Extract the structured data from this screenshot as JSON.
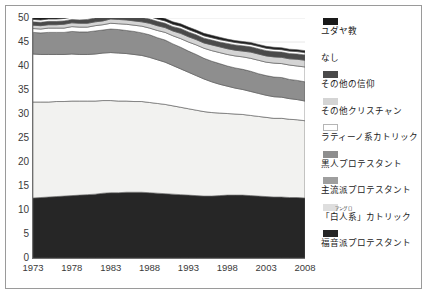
{
  "chart_data": {
    "type": "area",
    "stacked": true,
    "title": "",
    "xlabel": "",
    "ylabel": "",
    "x": [
      1973,
      1974,
      1975,
      1976,
      1977,
      1978,
      1979,
      1980,
      1981,
      1982,
      1983,
      1984,
      1985,
      1986,
      1987,
      1988,
      1989,
      1990,
      1991,
      1992,
      1993,
      1994,
      1995,
      1996,
      1997,
      1998,
      1999,
      2000,
      2001,
      2002,
      2003,
      2004,
      2005,
      2006,
      2007,
      2008
    ],
    "xticks": [
      1973,
      1978,
      1983,
      1988,
      1993,
      1998,
      2003,
      2008
    ],
    "xtick_labels": [
      "1973",
      "1978",
      "1983",
      "1988",
      "1993",
      "1998",
      "2003",
      "2008"
    ],
    "yticks": [
      0,
      5,
      10,
      15,
      20,
      25,
      30,
      35,
      40,
      45,
      50
    ],
    "ytick_labels": [
      "0",
      "5",
      "10",
      "15",
      "20",
      "25",
      "30",
      "35",
      "40",
      "45",
      "50"
    ],
    "ylim": [
      0,
      50
    ],
    "xlim": [
      1973,
      2008
    ],
    "grid": true,
    "legend_position": "right",
    "series": [
      {
        "name": "福音派プロテスタント",
        "color": "#262626",
        "values": [
          12.5,
          12.6,
          12.7,
          12.8,
          12.9,
          13.0,
          13.1,
          13.2,
          13.3,
          13.5,
          13.6,
          13.6,
          13.7,
          13.7,
          13.7,
          13.6,
          13.5,
          13.4,
          13.3,
          13.2,
          13.1,
          13.0,
          12.9,
          12.9,
          13.0,
          13.1,
          13.1,
          13.1,
          13.0,
          12.9,
          12.8,
          12.7,
          12.7,
          12.6,
          12.6,
          12.5
        ]
      },
      {
        "name": "「白人系」カトリック",
        "color": "#f2f2f0",
        "values": [
          20.0,
          19.9,
          19.8,
          19.8,
          19.7,
          19.7,
          19.6,
          19.5,
          19.4,
          19.3,
          19.2,
          19.1,
          19.0,
          18.9,
          18.9,
          18.8,
          18.7,
          18.6,
          18.4,
          18.2,
          18.0,
          17.8,
          17.6,
          17.4,
          17.2,
          17.0,
          16.9,
          16.8,
          16.7,
          16.6,
          16.5,
          16.4,
          16.4,
          16.3,
          16.2,
          16.1
        ]
      },
      {
        "name": "主流派プロテスタント",
        "color": "#ffffff",
        "values": [
          10.0,
          9.9,
          9.9,
          9.8,
          9.8,
          9.8,
          9.7,
          9.7,
          9.8,
          9.9,
          10.0,
          10.0,
          9.9,
          9.8,
          9.6,
          9.4,
          9.1,
          8.8,
          8.4,
          8.0,
          7.6,
          7.2,
          6.8,
          6.4,
          6.0,
          5.7,
          5.4,
          5.2,
          5.0,
          4.8,
          4.6,
          4.5,
          4.4,
          4.3,
          4.2,
          4.1
        ]
      },
      {
        "name": "黒人プロテスタント",
        "color": "#8e8e8e",
        "values": [
          4.5,
          4.5,
          4.6,
          4.6,
          4.6,
          4.7,
          4.7,
          4.7,
          4.8,
          4.8,
          4.9,
          4.9,
          4.8,
          4.8,
          4.7,
          4.7,
          4.6,
          4.6,
          4.5,
          4.5,
          4.4,
          4.4,
          4.3,
          4.3,
          4.3,
          4.2,
          4.2,
          4.2,
          4.2,
          4.1,
          4.1,
          4.1,
          4.1,
          4.0,
          4.0,
          4.0
        ]
      },
      {
        "name": "ラティーノ系カトリック",
        "color": "#ffffff",
        "values": [
          0.8,
          0.8,
          0.9,
          0.9,
          0.9,
          1.0,
          1.0,
          1.0,
          1.1,
          1.1,
          1.2,
          1.2,
          1.3,
          1.3,
          1.4,
          1.4,
          1.5,
          1.6,
          1.7,
          1.8,
          1.9,
          2.0,
          2.1,
          2.2,
          2.3,
          2.4,
          2.5,
          2.6,
          2.7,
          2.8,
          2.8,
          2.9,
          2.9,
          3.0,
          3.0,
          3.1
        ]
      },
      {
        "name": "その他クリスチャン",
        "color": "#d4d4d4",
        "values": [
          0.7,
          0.7,
          0.7,
          0.7,
          0.8,
          0.8,
          0.8,
          0.8,
          0.8,
          0.8,
          0.9,
          0.9,
          0.9,
          0.9,
          0.9,
          1.0,
          1.0,
          1.0,
          1.0,
          1.1,
          1.1,
          1.1,
          1.1,
          1.2,
          1.2,
          1.2,
          1.2,
          1.2,
          1.3,
          1.3,
          1.3,
          1.3,
          1.3,
          1.3,
          1.4,
          1.4
        ]
      },
      {
        "name": "その他の信仰",
        "color": "#4a4a4a",
        "values": [
          0.7,
          0.7,
          0.7,
          0.7,
          0.7,
          0.7,
          0.7,
          0.8,
          0.8,
          0.8,
          0.8,
          0.8,
          0.8,
          0.8,
          0.9,
          0.9,
          0.9,
          0.9,
          0.9,
          1.0,
          1.0,
          1.0,
          1.0,
          1.0,
          1.0,
          1.1,
          1.1,
          1.1,
          1.1,
          1.1,
          1.1,
          1.1,
          1.1,
          1.1,
          1.1,
          1.1
        ]
      },
      {
        "name": "なし",
        "color": "#ffffff",
        "values": [
          0.5,
          0.5,
          0.5,
          0.5,
          0.5,
          0.5,
          0.5,
          0.5,
          0.5,
          0.5,
          0.5,
          0.5,
          0.5,
          0.5,
          0.5,
          0.5,
          0.5,
          0.5,
          0.5,
          0.5,
          0.5,
          0.5,
          0.5,
          0.5,
          0.5,
          0.5,
          0.5,
          0.5,
          0.5,
          0.5,
          0.5,
          0.5,
          0.5,
          0.5,
          0.5,
          0.5
        ]
      },
      {
        "name": "ユダヤ教",
        "color": "#1a1a1a",
        "values": [
          0.6,
          0.6,
          0.6,
          0.6,
          0.6,
          0.6,
          0.6,
          0.6,
          0.6,
          0.6,
          0.6,
          0.6,
          0.6,
          0.6,
          0.5,
          0.5,
          0.5,
          0.5,
          0.5,
          0.5,
          0.5,
          0.5,
          0.5,
          0.5,
          0.5,
          0.4,
          0.4,
          0.4,
          0.4,
          0.4,
          0.4,
          0.4,
          0.4,
          0.4,
          0.4,
          0.4
        ]
      }
    ]
  },
  "legend": {
    "items": [
      {
        "label": "ユダヤ教",
        "color": "#1a1a1a",
        "border": "#1a1a1a"
      },
      {
        "label": "なし",
        "color": "#ffffff",
        "border": "#ffffff"
      },
      {
        "label": "その他の信仰",
        "color": "#4a4a4a",
        "border": "#4a4a4a"
      },
      {
        "label": "その他クリスチャン",
        "color": "#d4d4d4",
        "border": "#d4d4d4"
      },
      {
        "label": "ラティーノ系カトリック",
        "color": "#ffffff",
        "border": "#b5b5b5"
      },
      {
        "label": "黒人プロテスタント",
        "color": "#8e8e8e",
        "border": "#8e8e8e"
      },
      {
        "label": "主流派プロテスタント",
        "color": "#9e9e9e",
        "border": "#9e9e9e"
      },
      {
        "label": "「白人系」カトリック",
        "ruby": "アングロ",
        "ruby_base": "白人系",
        "prefix": "「",
        "suffix": "」カトリック",
        "color": "#dedede",
        "border": "#dedede"
      },
      {
        "label": "福音派プロテスタント",
        "color": "#262626",
        "border": "#262626"
      }
    ]
  },
  "colors": {
    "axis": "#6f6f6f",
    "grid": "#e8e8e8",
    "text": "#3a3a3a",
    "frame": "#9a9a9a",
    "background": "#ffffff"
  }
}
